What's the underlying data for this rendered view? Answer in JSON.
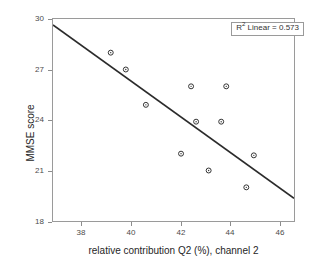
{
  "chart_data": {
    "type": "scatter",
    "title": "",
    "xlabel": "relative contribution Q2 (%), channel 2",
    "ylabel": "MMSE score",
    "xlim": [
      37.3,
      46.9
    ],
    "ylim": [
      18,
      30
    ],
    "xticks": [
      38,
      40,
      42,
      44,
      46
    ],
    "yticks": [
      18,
      21,
      24,
      27,
      30
    ],
    "grid": false,
    "legend_position": "top-right",
    "annotation": {
      "symbol": "R",
      "superscript": "2",
      "text": " Linear = 0.573",
      "r_squared": 0.573,
      "full_text": "R2 Linear = 0.573"
    },
    "marker": {
      "shape": "circle-open-with-dot",
      "size": 5,
      "edge_color": "#333333",
      "face_color": "#ffffff"
    },
    "points": [
      {
        "x": 39.6,
        "y": 28.0
      },
      {
        "x": 40.2,
        "y": 27.0
      },
      {
        "x": 41.0,
        "y": 24.9
      },
      {
        "x": 42.8,
        "y": 26.0
      },
      {
        "x": 44.2,
        "y": 26.0
      },
      {
        "x": 43.0,
        "y": 23.9
      },
      {
        "x": 44.0,
        "y": 23.9
      },
      {
        "x": 42.4,
        "y": 22.0
      },
      {
        "x": 43.5,
        "y": 21.0
      },
      {
        "x": 45.3,
        "y": 21.9
      },
      {
        "x": 45.0,
        "y": 20.0
      }
    ],
    "fit_line": {
      "type": "linear",
      "color": "#2b2b2b",
      "width": 1.6,
      "x_start": 37.3,
      "y_start": 29.65,
      "x_end": 46.9,
      "y_end": 19.35
    }
  },
  "axes": {
    "x_tick_labels": [
      "38",
      "40",
      "42",
      "44",
      "46"
    ],
    "y_tick_labels": [
      "18",
      "21",
      "24",
      "27",
      "30"
    ],
    "x_title": "relative contribution Q2 (%), channel 2",
    "y_title": "MMSE score"
  }
}
